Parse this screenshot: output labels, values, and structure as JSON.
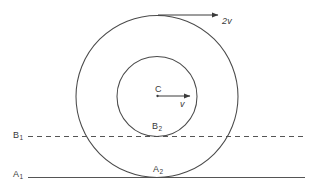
{
  "figure": {
    "stroke_color": "#4a4a4a",
    "text_color": "#3a3a3a",
    "background_color": "#ffffff"
  },
  "labels": {
    "center": "C",
    "inner_velocity": "v",
    "outer_velocity": "2v",
    "line_b1": "B",
    "line_b1_sub": "1",
    "line_a1": "A",
    "line_a1_sub": "1",
    "point_b2": "B",
    "point_b2_sub": "2",
    "point_a2": "A",
    "point_a2_sub": "2"
  },
  "geometry": {
    "center_x": 157,
    "center_y": 96.5,
    "outer_radius": 81,
    "inner_radius": 40,
    "dashed_line_y": 136.5,
    "solid_line_y": 177.5,
    "line_x_start": 28,
    "line_x_end": 305,
    "arrow_2v_start_x": 158,
    "arrow_2v_end_x": 219,
    "arrow_2v_y": 15,
    "arrow_v_start_x": 158,
    "arrow_v_end_x": 191,
    "arrow_v_y": 96
  }
}
